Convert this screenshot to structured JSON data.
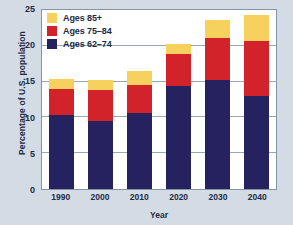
{
  "chart_data": {
    "type": "bar",
    "stacked": true,
    "title": "",
    "xlabel": "Year",
    "ylabel": "Percentage of U.S. population",
    "categories": [
      "1990",
      "2000",
      "2010",
      "2020",
      "2030",
      "2040"
    ],
    "ylim": [
      0,
      25
    ],
    "yticks": [
      0,
      5,
      10,
      15,
      20,
      25
    ],
    "ytick_labels": [
      "0",
      "5",
      "10",
      "15",
      "20",
      "25"
    ],
    "grid": true,
    "grid_axis": "y",
    "legend_position": "top-left",
    "series": [
      {
        "name": "Ages 62–74",
        "color": "#262260",
        "values": [
          10.2,
          9.4,
          10.5,
          14.2,
          15.1,
          12.9
        ]
      },
      {
        "name": "Ages 75–84",
        "color": "#d3232a",
        "values": [
          3.6,
          4.3,
          3.8,
          4.4,
          5.8,
          7.6
        ]
      },
      {
        "name": "Ages 85+",
        "color": "#f7d15e",
        "values": [
          1.4,
          1.4,
          2.0,
          1.4,
          2.5,
          3.6
        ]
      }
    ],
    "totals": [
      15.2,
      15.1,
      16.3,
      20.0,
      23.4,
      24.1
    ],
    "colors": {
      "background": "#d3dce4",
      "plot_background": "#ffffff",
      "axis": "#8794a6",
      "gridline": "#9aa7b5",
      "text": "#1d2b45"
    }
  },
  "legend": {
    "items": [
      {
        "label": "Ages 85+",
        "color": "#f7d15e"
      },
      {
        "label": "Ages 75–84",
        "color": "#d3232a"
      },
      {
        "label": "Ages 62–74",
        "color": "#262260"
      }
    ]
  }
}
